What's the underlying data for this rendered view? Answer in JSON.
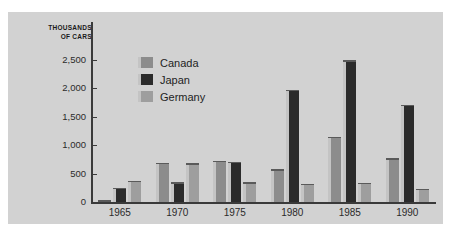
{
  "chart_data": {
    "type": "bar",
    "title": "",
    "subtitle": "",
    "xlabel": "",
    "ylabel": "THOUSANDS\nOF CARS",
    "categories": [
      "1965",
      "1970",
      "1975",
      "1980",
      "1985",
      "1990"
    ],
    "series": [
      {
        "name": "Canada",
        "color": "#8c8c8c",
        "values": [
          30,
          690,
          730,
          580,
          1150,
          770
        ]
      },
      {
        "name": "Japan",
        "color": "#2b2b2b",
        "values": [
          250,
          350,
          710,
          1980,
          2500,
          1710
        ]
      },
      {
        "name": "Germany",
        "color": "#9e9e9e",
        "values": [
          375,
          680,
          350,
          320,
          340,
          230
        ]
      }
    ],
    "ylim": [
      0,
      2650
    ],
    "yticks": [
      0,
      500,
      1000,
      1500,
      2000,
      2500
    ],
    "ytick_labels": [
      "0",
      "500",
      "1,000",
      "1,500",
      "2,000",
      "2,500"
    ],
    "grid": false,
    "legend_position": "upper-left-inside"
  },
  "legend": {
    "items": [
      {
        "label": "Canada"
      },
      {
        "label": "Japan"
      },
      {
        "label": "Germany"
      }
    ]
  },
  "colors": {
    "panel_background": "#d2d2d2",
    "page_background": "#ffffff",
    "axis": "#3a3a3a",
    "text": "#2b2b2b",
    "canada": "#8c8c8c",
    "japan": "#2b2b2b",
    "germany": "#9e9e9e",
    "bevel_light": "#c4c4c4"
  }
}
